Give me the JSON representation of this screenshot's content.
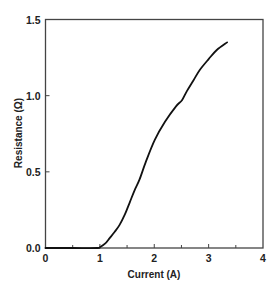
{
  "chart_data": {
    "type": "line",
    "title": "",
    "xlabel": "Current (A)",
    "ylabel": "Resistance (Ω)",
    "xlim": [
      0,
      4
    ],
    "ylim": [
      0,
      1.5
    ],
    "xticks": [
      0,
      1,
      2,
      3,
      4
    ],
    "xtick_labels": [
      "0",
      "1",
      "2",
      "3",
      "4"
    ],
    "x_minor_ticks": [
      0.5,
      1.5,
      2.5,
      3.5
    ],
    "yticks": [
      0.0,
      0.5,
      1.0,
      1.5
    ],
    "ytick_labels": [
      "0.0",
      "0.5",
      "1.0",
      "1.5"
    ],
    "grid": false,
    "legend": null,
    "series": [
      {
        "name": "Resistance",
        "color": "#111111",
        "x": [
          0.0,
          0.5,
          0.95,
          1.0,
          1.1,
          1.18,
          1.27,
          1.36,
          1.46,
          1.55,
          1.64,
          1.73,
          1.85,
          2.01,
          2.2,
          2.4,
          2.51,
          2.6,
          2.72,
          2.84,
          3.0,
          3.15,
          3.34
        ],
        "y": [
          0.0,
          0.0,
          0.0,
          0.005,
          0.03,
          0.065,
          0.105,
          0.15,
          0.22,
          0.3,
          0.38,
          0.45,
          0.57,
          0.71,
          0.83,
          0.93,
          0.97,
          1.03,
          1.1,
          1.17,
          1.24,
          1.3,
          1.35
        ]
      }
    ]
  }
}
